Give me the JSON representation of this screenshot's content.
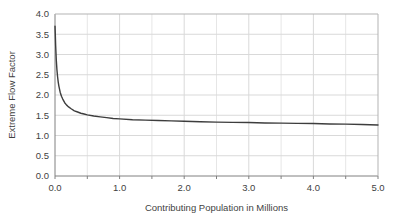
{
  "chart_data": {
    "type": "line",
    "title": "",
    "subtitle": "",
    "xlabel": "Contributing Population in Millions",
    "ylabel": "Extreme Flow Factor",
    "xlim": [
      0.0,
      5.0
    ],
    "ylim": [
      0.0,
      4.0
    ],
    "grid": true,
    "legend": "none",
    "x_major_step": 1.0,
    "x_minor_step": 0.5,
    "y_major_step": 0.5,
    "xticks": [
      "0.0",
      "1.0",
      "2.0",
      "3.0",
      "4.0",
      "5.0"
    ],
    "xtick_values": [
      0.0,
      1.0,
      2.0,
      3.0,
      4.0,
      5.0
    ],
    "yticks": [
      "0.0",
      "0.5",
      "1.0",
      "1.5",
      "2.0",
      "2.5",
      "3.0",
      "3.5",
      "4.0"
    ],
    "ytick_values": [
      0.0,
      0.5,
      1.0,
      1.5,
      2.0,
      2.5,
      3.0,
      3.5,
      4.0
    ],
    "x_minor_values": [
      0.5,
      1.5,
      2.5,
      3.5,
      4.5
    ],
    "series": [
      {
        "name": "Extreme Flow Factor",
        "color": "#3d3d3d",
        "line_width": 1.4,
        "x": [
          0.0,
          0.005,
          0.01,
          0.02,
          0.03,
          0.04,
          0.05,
          0.06,
          0.08,
          0.1,
          0.12,
          0.15,
          0.18,
          0.2,
          0.25,
          0.3,
          0.35,
          0.4,
          0.45,
          0.5,
          0.6,
          0.7,
          0.8,
          0.9,
          1.0,
          1.2,
          1.4,
          1.6,
          1.8,
          2.0,
          2.25,
          2.5,
          2.75,
          3.0,
          3.25,
          3.5,
          3.75,
          4.0,
          4.25,
          4.5,
          4.75,
          5.0
        ],
        "y": [
          3.7,
          3.48,
          3.22,
          2.86,
          2.62,
          2.45,
          2.32,
          2.22,
          2.07,
          1.97,
          1.9,
          1.81,
          1.75,
          1.72,
          1.66,
          1.61,
          1.58,
          1.55,
          1.53,
          1.51,
          1.48,
          1.46,
          1.44,
          1.42,
          1.41,
          1.39,
          1.38,
          1.37,
          1.36,
          1.35,
          1.34,
          1.33,
          1.325,
          1.32,
          1.31,
          1.305,
          1.3,
          1.295,
          1.285,
          1.28,
          1.27,
          1.26
        ]
      }
    ],
    "notes": {
      "curve_start_value": "3.70",
      "curve_end_value": "1.26",
      "asymptote": "approximately 1.25"
    }
  },
  "colors": {
    "background": "#ffffff",
    "plot_background": "#ffffff",
    "gridline": "#d9d9d9",
    "gridline_minor": "#e6e6e6",
    "axis_line": "#808080",
    "tick_label": "#3f3f3f",
    "axis_title": "#3f3f3f",
    "curve": "#3d3d3d"
  }
}
